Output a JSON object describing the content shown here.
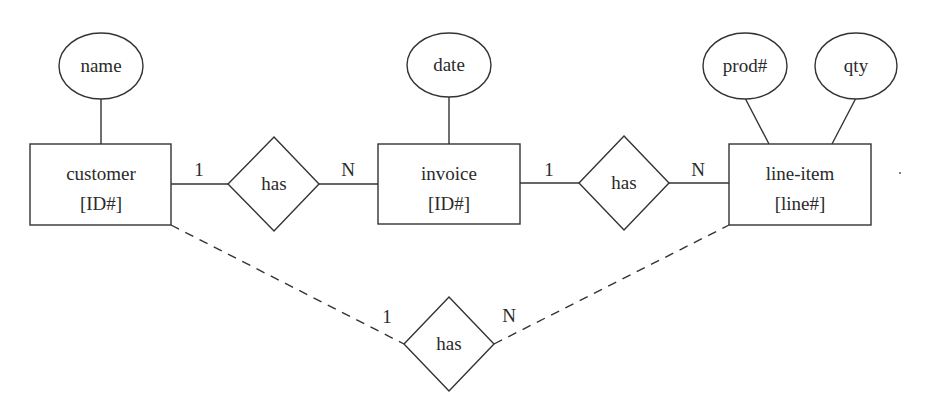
{
  "diagram": {
    "type": "entity-relationship",
    "entities": [
      {
        "id": "customer",
        "label": "customer",
        "key": "[ID#]"
      },
      {
        "id": "invoice",
        "label": "invoice",
        "key": "[ID#]"
      },
      {
        "id": "line_item",
        "label": "line-item",
        "key": "[line#]"
      }
    ],
    "attributes": [
      {
        "id": "name",
        "label": "name",
        "entity": "customer"
      },
      {
        "id": "date",
        "label": "date",
        "entity": "invoice"
      },
      {
        "id": "prod",
        "label": "prod#",
        "entity": "line_item"
      },
      {
        "id": "qty",
        "label": "qty",
        "entity": "line_item"
      }
    ],
    "relationships": [
      {
        "id": "has1",
        "label": "has",
        "from": "customer",
        "to": "invoice",
        "from_card": "1",
        "to_card": "N",
        "style": "solid"
      },
      {
        "id": "has2",
        "label": "has",
        "from": "invoice",
        "to": "line_item",
        "from_card": "1",
        "to_card": "N",
        "style": "solid"
      },
      {
        "id": "has3",
        "label": "has",
        "from": "customer",
        "to": "line_item",
        "from_card": "1",
        "to_card": "N",
        "style": "dashed"
      }
    ]
  }
}
